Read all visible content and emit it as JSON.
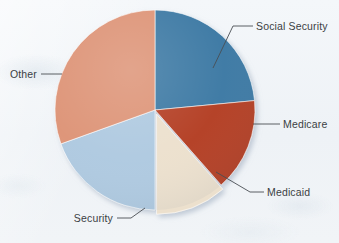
{
  "chart_data": {
    "type": "pie",
    "title": "",
    "subtitle": "",
    "xlabel": "",
    "ylabel": "",
    "legend_position": "none",
    "grid": false,
    "labels_placement": "outside-with-leader-lines",
    "start_angle_deg": 0,
    "direction": "clockwise",
    "categories": [
      "Social Security",
      "Medicare",
      "Medicaid",
      "Security",
      "Other"
    ],
    "values": [
      23.5,
      15.0,
      11.5,
      19.5,
      30.5
    ],
    "units": "percent",
    "colors": [
      "#3a78a3",
      "#b33e20",
      "#ece0cd",
      "#aec9e0",
      "#dd9376"
    ],
    "slices": [
      {
        "label": "Social Security",
        "value": 23.5,
        "color": "#3a78a3",
        "start_angle": 0,
        "end_angle": 84.6,
        "exploded": false
      },
      {
        "label": "Medicare",
        "value": 15.0,
        "color": "#b33e20",
        "start_angle": 84.6,
        "end_angle": 138.6,
        "exploded": false
      },
      {
        "label": "Medicaid",
        "value": 11.5,
        "color": "#ece0cd",
        "start_angle": 138.6,
        "end_angle": 180.0,
        "exploded": true
      },
      {
        "label": "Security",
        "value": 19.5,
        "color": "#aec9e0",
        "start_angle": 180.0,
        "end_angle": 250.2,
        "exploded": false
      },
      {
        "label": "Other",
        "value": 30.5,
        "color": "#dd9376",
        "start_angle": 250.2,
        "end_angle": 360.0,
        "exploded": false
      }
    ]
  },
  "labels": {
    "social_security": "Social Security",
    "medicare": "Medicare",
    "medicaid": "Medicaid",
    "security": "Security",
    "other": "Other"
  },
  "colors": {
    "background": "#f2f5f8",
    "text": "#3b3f44",
    "leader_line": "#4a4e53",
    "slice_border": "#ffffff",
    "social_security": "#3a78a3",
    "medicare": "#b33e20",
    "medicaid": "#ece0cd",
    "security": "#aec9e0",
    "other": "#dd9376"
  }
}
